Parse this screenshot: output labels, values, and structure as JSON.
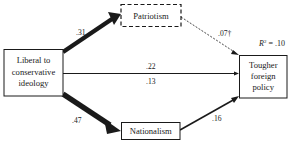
{
  "diagram": {
    "nodes": {
      "ideology": {
        "lines": [
          "Liberal to",
          "conservative",
          "ideology"
        ]
      },
      "patriotism": {
        "lines": [
          "Patriotism"
        ],
        "style": "dashed"
      },
      "nationalism": {
        "lines": [
          "Nationalism"
        ],
        "style": "solid"
      },
      "policy": {
        "lines": [
          "Tougher",
          "foreign",
          "policy"
        ]
      }
    },
    "edges": [
      {
        "from": "ideology",
        "to": "patriotism",
        "label": ".31",
        "style": "solid",
        "weight": "heavy"
      },
      {
        "from": "ideology",
        "to": "nationalism",
        "label": ".47",
        "style": "solid",
        "weight": "heavy"
      },
      {
        "from": "ideology",
        "to": "policy",
        "label": ".22",
        "label2": ".13",
        "style": "solid",
        "weight": "thin"
      },
      {
        "from": "patriotism",
        "to": "policy",
        "label": ".07†",
        "style": "dashed",
        "weight": "thin"
      },
      {
        "from": "nationalism",
        "to": "policy",
        "label": ".16",
        "style": "solid",
        "weight": "medium"
      }
    ],
    "r_squared": {
      "prefix": "R",
      "sup": "2",
      "suffix": " = .10"
    },
    "colors": {
      "ink": "#1a1a1a",
      "background": "#ffffff"
    }
  }
}
